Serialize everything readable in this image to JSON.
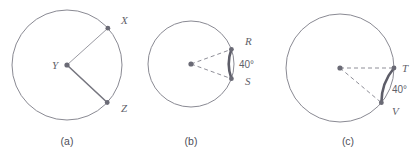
{
  "figure": {
    "background_color": "#ffffff",
    "stroke_color": "#8a8a93",
    "bold_arc_color": "#5d5d68",
    "label_color": "#5f5f6a",
    "width": 420,
    "height": 162
  },
  "panels": [
    {
      "caption": "(a)",
      "caption_x": 67,
      "caption_y": 145,
      "center": {
        "x": 67,
        "y": 65,
        "label": "Y",
        "label_x": 52,
        "label_y": 69
      },
      "radius": 55,
      "points": [
        {
          "label": "X",
          "angle_deg": 42,
          "label_x": 121,
          "label_y": 24,
          "style": "thin"
        },
        {
          "label": "Z",
          "angle_deg": -43,
          "label_x": 121,
          "label_y": 112,
          "style": "solid"
        }
      ],
      "arc": null,
      "angle_label": null
    },
    {
      "caption": "(b)",
      "caption_x": 191,
      "caption_y": 145,
      "center": {
        "x": 191,
        "y": 64,
        "label": "",
        "label_x": 0,
        "label_y": 0
      },
      "radius": 43,
      "points": [
        {
          "label": "R",
          "angle_deg": 20,
          "label_x": 245,
          "label_y": 45,
          "style": "dashed"
        },
        {
          "label": "S",
          "angle_deg": -20,
          "label_x": 245,
          "label_y": 85,
          "style": "dashed"
        }
      ],
      "arc": {
        "start_deg": -20,
        "end_deg": 20
      },
      "angle_label": {
        "text": "40°",
        "x": 239,
        "y": 68
      }
    },
    {
      "caption": "(c)",
      "caption_x": 348,
      "caption_y": 145,
      "center": {
        "x": 340,
        "y": 68,
        "label": "",
        "label_x": 0,
        "label_y": 0
      },
      "radius": 54,
      "points": [
        {
          "label": "T",
          "angle_deg": 0,
          "label_x": 402,
          "label_y": 72,
          "style": "dashed"
        },
        {
          "label": "V",
          "angle_deg": -40,
          "label_x": 392,
          "label_y": 115,
          "style": "dashed"
        }
      ],
      "arc": {
        "start_deg": -40,
        "end_deg": 0
      },
      "angle_label": {
        "text": "40°",
        "x": 392,
        "y": 93
      }
    }
  ]
}
